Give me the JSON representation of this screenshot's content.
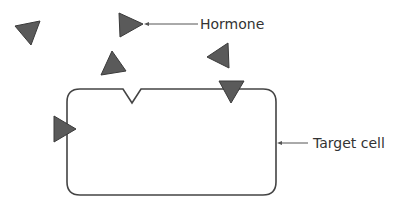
{
  "diagram": {
    "labels": {
      "hormone": "Hormone",
      "target_cell": "Target cell"
    },
    "colors": {
      "hormone_fill": "#5a5a5a",
      "hormone_stroke": "#3a3a3a",
      "cell_stroke": "#444444",
      "leader_line": "#555555"
    },
    "elements": [
      {
        "name": "hormone-molecule",
        "description": "free hormone, upper left"
      },
      {
        "name": "hormone-molecule",
        "description": "labeled hormone"
      },
      {
        "name": "hormone-molecule",
        "description": "free hormone, above cell"
      },
      {
        "name": "hormone-molecule",
        "description": "free hormone, near receptor"
      },
      {
        "name": "hormone-molecule",
        "description": "hormone bound to top receptor"
      },
      {
        "name": "hormone-molecule",
        "description": "hormone bound to left receptor"
      },
      {
        "name": "receptor-site",
        "description": "empty receptor notch on top membrane"
      }
    ]
  }
}
